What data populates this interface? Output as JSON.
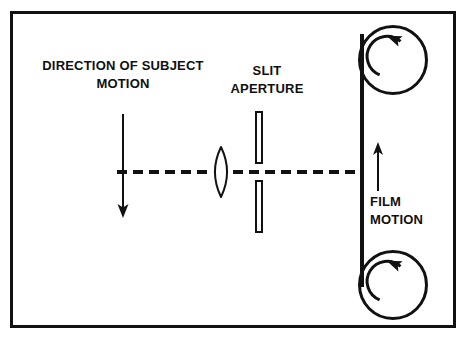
{
  "figure": {
    "frame": {
      "name": "outer-border",
      "x": 10,
      "y": 11,
      "width": 446,
      "height": 317,
      "stroke_width": 3,
      "color": "#111111"
    },
    "background_color": "#ffffff",
    "line_color": "#111111"
  },
  "labels": {
    "subject_motion": {
      "line1": "DIRECTION OF SUBJECT",
      "line2": "MOTION",
      "align": "center",
      "x": 123,
      "y1": 70,
      "y2": 88
    },
    "slit_aperture": {
      "line1": "SLIT",
      "line2": "APERTURE",
      "align": "center",
      "x": 267,
      "y1": 75,
      "y2": 93
    },
    "film_motion": {
      "line1": "FILM",
      "line2": "MOTION",
      "align": "start",
      "x": 370,
      "y1": 206,
      "y2": 224
    }
  },
  "elements": {
    "optical_axis": {
      "name": "optical-axis-dashed-line",
      "x1": 117,
      "x2": 362,
      "y": 172,
      "dash": "10 6",
      "stroke_width": 4
    },
    "subject_arrow": {
      "name": "subject-motion-arrow",
      "direction": "down",
      "x": 123,
      "y_start": 114,
      "y_end": 218,
      "stroke_width": 2,
      "head_width": 11,
      "head_length": 14
    },
    "lens": {
      "name": "biconvex-lens",
      "cx": 221,
      "cy": 172,
      "half_width": 11,
      "half_height": 25,
      "stroke_width": 2
    },
    "slit_bar_top": {
      "name": "slit-aperture-bar-top",
      "x": 255,
      "y": 111,
      "width": 8,
      "height": 53,
      "stroke_width": 2
    },
    "slit_bar_bottom": {
      "name": "slit-aperture-bar-bottom",
      "x": 255,
      "y": 180,
      "width": 8,
      "height": 53,
      "stroke_width": 2
    },
    "film_strip": {
      "name": "film-strip-line",
      "x": 362,
      "y_top": 34,
      "y_bottom": 287,
      "stroke_width": 4
    },
    "film_arrow": {
      "name": "film-motion-arrow",
      "direction": "up",
      "x": 378,
      "y_start": 191,
      "y_end": 142,
      "stroke_width": 2,
      "head_width": 10,
      "head_length": 13
    },
    "reel_top": {
      "name": "film-reel-top",
      "cx": 393,
      "cy": 60,
      "r": 35,
      "stroke_width": 3,
      "rotation": "counterclockwise"
    },
    "reel_bottom": {
      "name": "film-reel-bottom",
      "cx": 393,
      "cy": 285,
      "r": 35,
      "stroke_width": 3,
      "rotation": "counterclockwise"
    },
    "reel_arrow_top": {
      "name": "reel-rotation-arrow-top",
      "cx": 393,
      "cy": 60,
      "r": 20,
      "stroke_width": 3
    },
    "reel_arrow_bottom": {
      "name": "reel-rotation-arrow-bottom",
      "cx": 393,
      "cy": 285,
      "r": 20,
      "stroke_width": 3
    }
  }
}
